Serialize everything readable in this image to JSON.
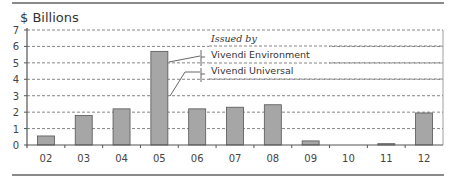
{
  "chart_data": {
    "type": "bar",
    "title": "$ Billions",
    "xlabel": "",
    "ylabel": "$ Billions",
    "ylim": [
      0,
      7
    ],
    "yticks": [
      0,
      1,
      2,
      3,
      4,
      5,
      6,
      7
    ],
    "grid": true,
    "categories": [
      "02",
      "03",
      "04",
      "05",
      "06",
      "07",
      "08",
      "09",
      "10",
      "11",
      "12"
    ],
    "values": [
      0.55,
      1.8,
      2.2,
      5.7,
      2.2,
      2.3,
      2.45,
      0.25,
      0,
      0.08,
      1.95
    ],
    "legend": {
      "heading": "Issued by",
      "entries": [
        "Vivendi Environment",
        "Vivendi Universal"
      ],
      "position": "top-right"
    },
    "annotations": [
      {
        "text": "Vivendi Environment",
        "points_to": "05 upper portion"
      },
      {
        "text": "Vivendi Universal",
        "points_to": "05 lower portion"
      }
    ],
    "colors": {
      "bar_fill": "#a6a6a6",
      "bar_stroke": "#555555",
      "grid": "#666666",
      "axis": "#555555",
      "rule": "#8a8a8a"
    }
  }
}
